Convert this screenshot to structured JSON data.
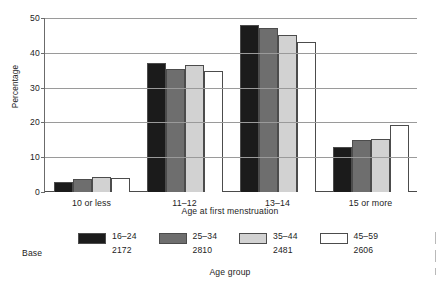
{
  "chart_data": {
    "type": "bar",
    "title": "",
    "xlabel": "Age at first menstruation",
    "ylabel": "Percentage",
    "ylim": [
      0,
      50
    ],
    "yticks": [
      0,
      10,
      20,
      30,
      40,
      50
    ],
    "ytick_labels": [
      "0",
      "10",
      "20",
      "30",
      "40",
      "50"
    ],
    "grid": true,
    "legend_position": "bottom",
    "legend_title": "Age group",
    "categories": [
      "10 or less",
      "11–12",
      "13–14",
      "15 or more"
    ],
    "series": [
      {
        "name": "16–24",
        "base": "2172",
        "color": "#1b1b1b",
        "values": [
          2.8,
          37.0,
          48.0,
          12.8
        ]
      },
      {
        "name": "25–34",
        "base": "2810",
        "color": "#6e6e6e",
        "values": [
          3.6,
          35.4,
          47.2,
          14.9
        ]
      },
      {
        "name": "35–44",
        "base": "2481",
        "color": "#d2d2d2",
        "values": [
          4.2,
          36.4,
          45.2,
          15.3
        ]
      },
      {
        "name": "45–59",
        "base": "2606",
        "color": "#ffffff",
        "values": [
          4.0,
          34.8,
          43.2,
          19.3
        ]
      }
    ]
  },
  "labels": {
    "base_label": "Base"
  }
}
